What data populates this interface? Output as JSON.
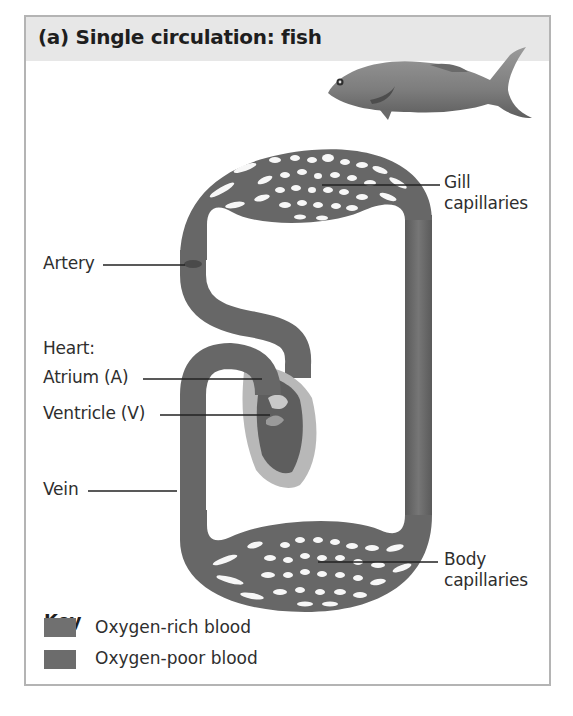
{
  "figure": {
    "title": "(a) Single circulation: fish",
    "icon": "fish-illustration"
  },
  "labels": {
    "gill_capillaries": [
      "Gill",
      "capillaries"
    ],
    "artery": "Artery",
    "heart": "Heart:",
    "atrium": "Atrium (A)",
    "ventricle": "Ventricle (V)",
    "vein": "Vein",
    "body_capillaries": [
      "Body",
      "capillaries"
    ]
  },
  "key": {
    "title": "Key",
    "items": [
      {
        "label": "Oxygen-rich blood",
        "color": "#707070"
      },
      {
        "label": "Oxygen-poor blood",
        "color": "#6c6c6c"
      }
    ]
  },
  "colors": {
    "vessel": "#6b6b6b",
    "vessel_dark": "#555555",
    "heart_outer": "#b8b8b8",
    "header_band": "#e7e7e7",
    "frame_border": "#b4b4b4"
  }
}
